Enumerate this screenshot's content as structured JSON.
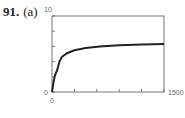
{
  "problem": {
    "number": "91.",
    "part": "(a)"
  },
  "chart_data": {
    "type": "line",
    "title": "",
    "xlabel": "",
    "ylabel": "",
    "xlim": [
      0,
      1500
    ],
    "ylim": [
      0,
      10
    ],
    "grid": false,
    "legend": null,
    "x_tick_labels": [
      "0",
      "1500"
    ],
    "y_tick_labels": [
      "0",
      "10"
    ],
    "x_ticks": [
      0,
      300,
      600,
      900,
      1200,
      1500
    ],
    "y_ticks": [
      0,
      2,
      4,
      6,
      8,
      10
    ],
    "series": [
      {
        "name": "curve",
        "x": [
          0,
          20,
          40,
          70,
          100,
          130,
          200,
          300,
          450,
          640,
          900,
          1200,
          1500
        ],
        "y": [
          0,
          1.3,
          2.2,
          2.9,
          4.0,
          4.6,
          5.1,
          5.5,
          5.8,
          6.0,
          6.15,
          6.25,
          6.3
        ]
      }
    ],
    "colors": {
      "line": "#222222",
      "frame": "#777777"
    }
  }
}
